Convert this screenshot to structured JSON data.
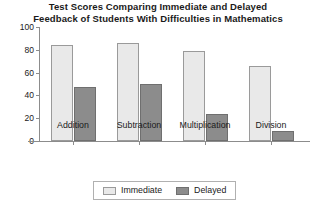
{
  "chart_data": {
    "type": "bar",
    "title": "Test Scores Comparing Immediate and Delayed Feedback of Students With Difficulties in Mathematics",
    "title_lines": [
      "Test Scores Comparing Immediate and Delayed",
      "Feedback of Students With Difficulties in Mathematics"
    ],
    "categories": [
      "Addition",
      "Subtraction",
      "Multiplication",
      "Division"
    ],
    "series": [
      {
        "name": "Immediate",
        "values": [
          84,
          86,
          79,
          66
        ],
        "color": "#e9e9e9"
      },
      {
        "name": "Delayed",
        "values": [
          47,
          50,
          24,
          9
        ],
        "color": "#8c8c8c"
      }
    ],
    "xlabel": "",
    "ylabel": "",
    "ylim": [
      0,
      100
    ],
    "yticks": [
      0,
      20,
      40,
      60,
      80,
      100
    ],
    "ytick_labels": [
      "0",
      "20",
      "40",
      "60",
      "80",
      "100"
    ],
    "grid": false,
    "legend_position": "bottom-center"
  },
  "legend": {
    "items": [
      {
        "label": "Immediate"
      },
      {
        "label": "Delayed"
      }
    ]
  }
}
